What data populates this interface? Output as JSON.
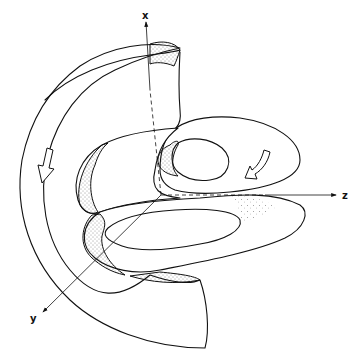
{
  "figure": {
    "type": "3d-surface-line-drawing",
    "axes": {
      "x": {
        "label": "x"
      },
      "y": {
        "label": "y"
      },
      "z": {
        "label": "z"
      }
    },
    "flow_arrows": [
      {
        "name": "left-flow-arrow",
        "direction": "down"
      },
      {
        "name": "right-flow-arrow",
        "direction": "down-left"
      }
    ],
    "colors": {
      "line": "#111111",
      "background": "#ffffff",
      "stipple": "#222222"
    }
  }
}
